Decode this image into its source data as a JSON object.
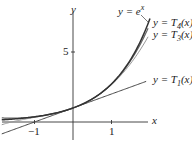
{
  "chart_data": {
    "type": "line",
    "title": "",
    "xlabel": "x",
    "ylabel": "y",
    "xlim": [
      -1.9,
      1.9
    ],
    "ylim": [
      -1,
      8.2
    ],
    "x_ticks": [
      "-1",
      "1"
    ],
    "y_ticks": [
      "5"
    ],
    "series": [
      {
        "name": "y = e^x",
        "label": "y = e",
        "sup": "x"
      },
      {
        "name": "y = T4(x)",
        "label": "y = T",
        "sub": "4",
        "tail": "(x)"
      },
      {
        "name": "y = T3(x)",
        "label": "y = T",
        "sub": "3",
        "tail": "(x)"
      },
      {
        "name": "y = T1(x)",
        "label": "y = T",
        "sub": "1",
        "tail": "(x)"
      }
    ],
    "grid": false
  },
  "labels": {
    "x_axis": "x",
    "y_axis": "y",
    "tick_neg1": "−1",
    "tick_1": "1",
    "tick_5": "5",
    "ex_main": "y = e",
    "ex_sup": "x",
    "t4_main": "y = T",
    "t4_sub": "4",
    "t4_tail": "(x)",
    "t3_main": "y = T",
    "t3_sub": "3",
    "t3_tail": "(x)",
    "t1_main": "y = T",
    "t1_sub": "1",
    "t1_tail": "(x)"
  }
}
